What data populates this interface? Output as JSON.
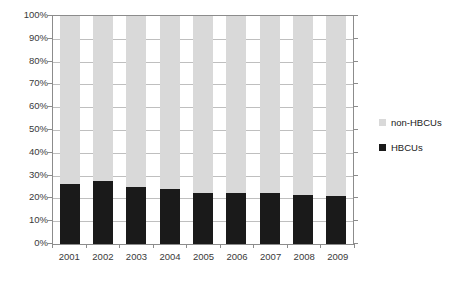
{
  "chart_data": {
    "type": "bar",
    "subtype": "stacked-percent",
    "title": "",
    "subtitle": "",
    "xlabel": "",
    "ylabel": "",
    "ylim": [
      0,
      100
    ],
    "y_unit": "%",
    "grid": true,
    "legend_position": "right",
    "categories": [
      "2001",
      "2002",
      "2003",
      "2004",
      "2005",
      "2006",
      "2007",
      "2008",
      "2009"
    ],
    "y_ticks": [
      "0%",
      "10%",
      "20%",
      "30%",
      "40%",
      "50%",
      "60%",
      "70%",
      "80%",
      "90%",
      "100%"
    ],
    "y_tick_values": [
      0,
      10,
      20,
      30,
      40,
      50,
      60,
      70,
      80,
      90,
      100
    ],
    "series": [
      {
        "name": "HBCUs",
        "color": "#1a1a1a",
        "values": [
          26.5,
          27.5,
          25.0,
          24.0,
          22.5,
          22.5,
          22.5,
          21.5,
          21.0
        ]
      },
      {
        "name": "non-HBCUs",
        "color": "#d9d9d9",
        "values": [
          73.5,
          72.5,
          75.0,
          76.0,
          77.5,
          77.5,
          77.5,
          78.5,
          79.0
        ]
      }
    ]
  },
  "legend": {
    "items": [
      {
        "label": "non-HBCUs",
        "color": "#d9d9d9"
      },
      {
        "label": "HBCUs",
        "color": "#1a1a1a"
      }
    ]
  },
  "colors": {
    "hbcu": "#1a1a1a",
    "non_hbcu": "#d9d9d9",
    "gridline": "#bfbfbf",
    "axis": "#8c8c8c",
    "text": "#3a3a3a",
    "background": "#ffffff"
  }
}
